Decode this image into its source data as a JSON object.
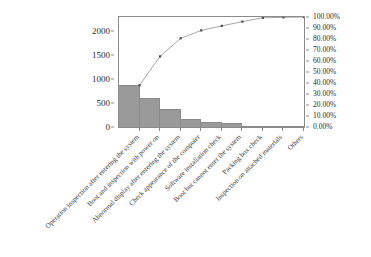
{
  "chart_data": {
    "type": "bar",
    "title": "",
    "subtitle": "",
    "xlabel": "",
    "ylabel": "",
    "categories": [
      "Operation inspection after entering the system",
      "Boot and inspection with power on",
      "Abnormal display after entering the system",
      "Check appearance of the computer",
      "Software installation check",
      "Boot but cannot enter the system",
      "Packing box check",
      "Inspection on attached materials",
      "Others"
    ],
    "series": [
      {
        "name": "Frequency",
        "type": "bar",
        "axis": "left",
        "values": [
          870,
          600,
          375,
          165,
          95,
          90,
          10,
          5,
          3
        ]
      },
      {
        "name": "Cumulative percentage",
        "type": "line",
        "axis": "right",
        "values": [
          38.0,
          64.2,
          80.6,
          87.8,
          91.9,
          95.8,
          99.3,
          99.7,
          100.0
        ]
      }
    ],
    "ylim": [
      0,
      2300
    ],
    "yticks": [
      0,
      500,
      1000,
      1500,
      2000
    ],
    "ytick_labels": [
      "0",
      "500",
      "1000",
      "1500",
      "2000"
    ],
    "y2lim": [
      0,
      100
    ],
    "y2ticks": [
      0,
      10,
      20,
      30,
      40,
      50,
      60,
      70,
      80,
      90,
      100
    ],
    "y2tick_labels": [
      "0.00%",
      "10.00%",
      "20.00%",
      "30.00%",
      "40.00%",
      "50.00%",
      "60.00%",
      "70.00%",
      "80.00%",
      "90.00%",
      "100.00%"
    ],
    "grid": false,
    "legend": "none",
    "colors": {
      "bar_fill": "#9a9a9a",
      "bar_edge": "#8a8a8a",
      "line": "#8f8f8f",
      "marker": "#4a4a4a",
      "axis": "#8b8b8b",
      "text": "#2b2b2b",
      "background": "#ffffff"
    }
  }
}
